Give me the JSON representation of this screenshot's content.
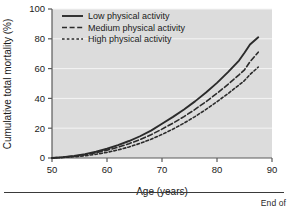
{
  "figure": {
    "caption_partial": "End of"
  },
  "chart_data": {
    "type": "line",
    "title": "",
    "xlabel": "Age (years)",
    "ylabel": "Cumulative total mortality (%)",
    "xlim": [
      50,
      90
    ],
    "ylim": [
      0,
      100
    ],
    "xticks": [
      50,
      60,
      70,
      80,
      90
    ],
    "yticks": [
      0,
      20,
      40,
      60,
      80,
      100
    ],
    "grid": "horizontal-white",
    "legend_position": "top-left-inside",
    "plot_background": "#dcdcdc",
    "line_color": "#2b2b2b",
    "x": [
      50,
      52,
      54,
      56,
      58,
      60,
      62,
      64,
      66,
      68,
      70,
      72,
      74,
      76,
      78,
      80,
      82,
      84,
      85,
      86,
      87.5
    ],
    "series": [
      {
        "name": "Low physical activity",
        "style": "solid",
        "values": [
          0,
          0.6,
          1.4,
          2.6,
          4.2,
          6.2,
          8.6,
          11.4,
          14.6,
          18.4,
          23.0,
          27.6,
          32.6,
          38.0,
          44.0,
          50.4,
          57.6,
          65.4,
          70.6,
          76.2,
          81.0
        ]
      },
      {
        "name": "Medium physical activity",
        "style": "dashed",
        "values": [
          0,
          0.5,
          1.2,
          2.2,
          3.6,
          5.2,
          7.2,
          9.6,
          12.4,
          15.6,
          19.4,
          23.4,
          27.8,
          32.6,
          37.8,
          43.4,
          49.4,
          55.8,
          59.2,
          64.6,
          71.0
        ]
      },
      {
        "name": "High physical activity",
        "style": "dotted",
        "values": [
          0,
          0.3,
          0.8,
          1.5,
          2.5,
          3.8,
          5.4,
          7.4,
          9.8,
          12.6,
          15.8,
          19.4,
          23.4,
          27.8,
          32.6,
          37.8,
          43.2,
          49.0,
          52.0,
          56.0,
          61.0
        ]
      }
    ]
  }
}
